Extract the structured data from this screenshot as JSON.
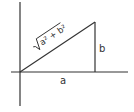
{
  "diagram": {
    "type": "right-triangle-pythagorean",
    "colors": {
      "stroke": "#333333",
      "background": "#ffffff"
    },
    "axes": {
      "horizontal": {
        "x1": 11,
        "y1": 72,
        "x2": 128,
        "y2": 72
      },
      "vertical": {
        "x1": 20,
        "y1": 2,
        "x2": 20,
        "y2": 106
      }
    },
    "triangle": {
      "origin": [
        20,
        72
      ],
      "base_end": [
        95,
        72
      ],
      "apex": [
        95,
        22
      ]
    },
    "labels": {
      "base": "a",
      "height": "b",
      "hypotenuse_radicand": "a² + b²",
      "hypotenuse_radical": "√"
    }
  }
}
